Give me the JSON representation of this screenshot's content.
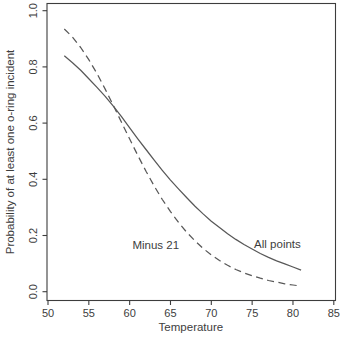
{
  "figure": {
    "background": "#ffffff",
    "ink_color": "#3d3d3d",
    "curve_color": "#585858"
  },
  "chart_data": {
    "type": "line",
    "title": "",
    "xlabel": "Temperature",
    "ylabel": "Probability of at least one o-ring incident",
    "xlim": [
      50,
      85
    ],
    "ylim": [
      0.0,
      1.0
    ],
    "x_ticks": [
      50,
      55,
      60,
      65,
      70,
      75,
      80,
      85
    ],
    "y_ticks": [
      "0.0",
      "0.2",
      "0.4",
      "0.6",
      "0.8",
      "1.0"
    ],
    "grid": false,
    "legend_position": "inline-annotations",
    "x": [
      52,
      53,
      54,
      55,
      56,
      57,
      58,
      59,
      60,
      61,
      62,
      63,
      64,
      65,
      66,
      67,
      68,
      69,
      70,
      71,
      72,
      73,
      74,
      75,
      76,
      77,
      78,
      79,
      80,
      81
    ],
    "series": [
      {
        "name": "All points",
        "style": "solid",
        "values": [
          0.84,
          0.815,
          0.788,
          0.758,
          0.727,
          0.695,
          0.66,
          0.623,
          0.583,
          0.544,
          0.506,
          0.468,
          0.432,
          0.397,
          0.365,
          0.334,
          0.304,
          0.277,
          0.251,
          0.228,
          0.206,
          0.186,
          0.168,
          0.152,
          0.136,
          0.122,
          0.11,
          0.099,
          0.088,
          0.077
        ]
      },
      {
        "name": "Minus 21",
        "style": "dashed",
        "values": [
          0.935,
          0.906,
          0.869,
          0.826,
          0.776,
          0.721,
          0.663,
          0.603,
          0.543,
          0.485,
          0.429,
          0.376,
          0.328,
          0.285,
          0.246,
          0.211,
          0.181,
          0.154,
          0.131,
          0.111,
          0.094,
          0.079,
          0.067,
          0.057,
          0.048,
          0.04,
          0.034,
          0.028,
          0.024,
          0.02
        ]
      }
    ],
    "annotations": [
      {
        "text": "Minus 21",
        "x": 63.2,
        "y": 0.165
      },
      {
        "text": "All points",
        "x": 78.1,
        "y": 0.17
      }
    ]
  }
}
